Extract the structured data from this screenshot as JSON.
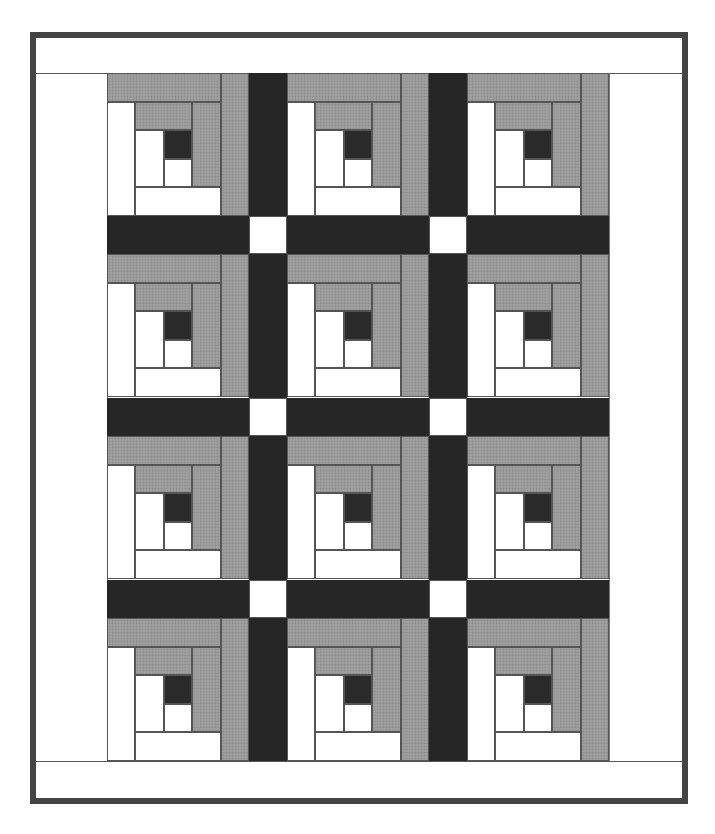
{
  "caption": "",
  "quilt": {
    "pattern": "log-cabin",
    "rows": 4,
    "cols": 3,
    "colors": {
      "frame": "#444444",
      "light": "#ffffff",
      "medium": "#9a9a9a",
      "dark": "#2a2a2a",
      "sashing": "#262626",
      "cornerstone": "#ffffff"
    }
  }
}
